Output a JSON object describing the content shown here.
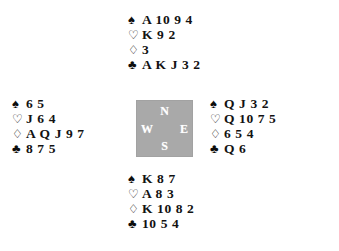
{
  "diagram": {
    "type": "bridge-hand-diagram",
    "background_color": "#ffffff",
    "text_color": "#121212"
  },
  "compass": {
    "background_color": "#a9a9a9",
    "label_color": "#ffffff",
    "north": "N",
    "south": "S",
    "west": "W",
    "east": "E"
  },
  "suit_symbols": {
    "spade": "♠",
    "heart": "♡",
    "diamond": "♢",
    "club": "♣"
  },
  "hands": {
    "north": {
      "position_label": "North",
      "spades": "A 10 9 4",
      "hearts": "K 9 2",
      "diamonds": "3",
      "clubs": "A K J 3 2"
    },
    "west": {
      "position_label": "West",
      "spades": "6 5",
      "hearts": "J 6 4",
      "diamonds": "A Q J 9 7",
      "clubs": "8 7 5"
    },
    "east": {
      "position_label": "East",
      "spades": "Q J 3 2",
      "hearts": "Q 10 7 5",
      "diamonds": "6 5 4",
      "clubs": "Q 6"
    },
    "south": {
      "position_label": "South",
      "spades": "K 8 7",
      "hearts": "A 8 3",
      "diamonds": "K 10 8 2",
      "clubs": "10 5 4"
    }
  }
}
